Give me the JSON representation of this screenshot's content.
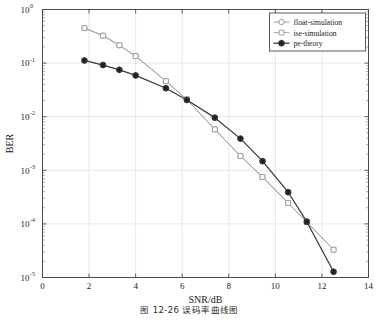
{
  "figure": {
    "caption": "图 12-26  误码率曲线图"
  },
  "chart_data": {
    "type": "line",
    "title": "",
    "xlabel": "SNR/dB",
    "ylabel": "BER",
    "xlim": [
      0,
      14
    ],
    "ylim": [
      1e-05,
      1
    ],
    "yscale": "log",
    "xscale": "linear",
    "grid": true,
    "xticks": [
      0,
      2,
      4,
      6,
      8,
      10,
      12,
      14
    ],
    "xtick_labels": [
      "0",
      "2",
      "4",
      "6",
      "8",
      "10",
      "12",
      "14"
    ],
    "yticks": [
      1,
      0.1,
      0.01,
      0.001,
      0.0001,
      1e-05
    ],
    "ytick_labels": [
      "10^0",
      "10^-1",
      "10^-2",
      "10^-3",
      "10^-4",
      "10^-5"
    ],
    "ytick_mantissa": [
      "10",
      "10",
      "10",
      "10",
      "10",
      "10"
    ],
    "ytick_exponent": [
      "0",
      "-1",
      "-2",
      "-3",
      "-4",
      "-5"
    ],
    "legend_position": "upper right",
    "series": [
      {
        "name": "float-simulation",
        "marker": "circle",
        "color": "#9a9a9a",
        "x": [
          1.8,
          2.6,
          3.3,
          4.0,
          5.3,
          6.2,
          7.4,
          8.5,
          9.45,
          10.55,
          11.35,
          12.5
        ],
        "y": [
          0.45,
          0.325,
          0.215,
          0.135,
          0.046,
          0.021,
          0.0058,
          0.00185,
          0.00075,
          0.000245,
          0.000108,
          3.3e-05
        ]
      },
      {
        "name": "ise-simulation",
        "marker": "square",
        "color": "#9a9a9a",
        "x": [
          1.8,
          2.6,
          3.3,
          4.0,
          5.3,
          6.2,
          7.4,
          8.5,
          9.45,
          10.55,
          11.35,
          12.5
        ],
        "y": [
          0.45,
          0.325,
          0.215,
          0.135,
          0.046,
          0.021,
          0.0058,
          0.00185,
          0.00075,
          0.000245,
          0.000108,
          3.3e-05
        ]
      },
      {
        "name": "pe-theory",
        "marker": "asterisk",
        "color": "#3a3a3a",
        "x": [
          1.8,
          2.6,
          3.3,
          4.0,
          5.3,
          6.2,
          7.4,
          8.5,
          9.45,
          10.55,
          11.35,
          12.5
        ],
        "y": [
          0.112,
          0.092,
          0.075,
          0.059,
          0.034,
          0.0205,
          0.0096,
          0.0039,
          0.00148,
          0.00039,
          0.00011,
          1.28e-05
        ]
      }
    ]
  },
  "legend": {
    "items": [
      {
        "label": "float-simulation",
        "marker": "circle",
        "color": "#8f8f8f"
      },
      {
        "label": "ise-simulation",
        "marker": "square",
        "color": "#9a9a9a"
      },
      {
        "label": "pe-theory",
        "marker": "asterisk",
        "color": "#3a3a3a"
      }
    ]
  }
}
